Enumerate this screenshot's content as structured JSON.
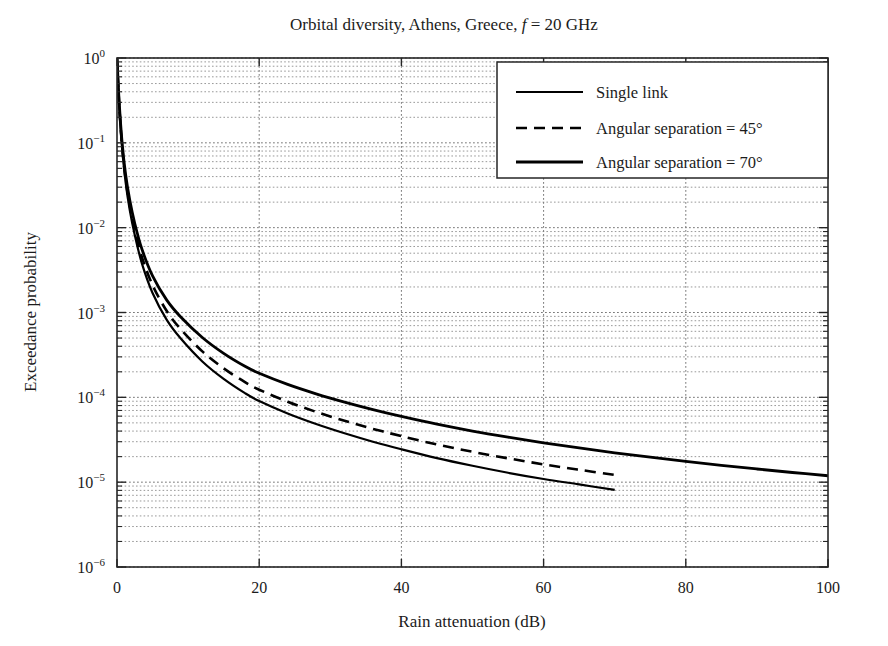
{
  "figure": {
    "title_main": "Orbital diversity, Athens, Greece, ",
    "title_italic": "f",
    "title_tail": " = 20 GHz",
    "background": "#ffffff"
  },
  "legend": {
    "position": "top-right",
    "items": [
      {
        "label": "Single link",
        "style": "solid",
        "width": 2.2,
        "color": "#000000"
      },
      {
        "label": "Angular separation = 45°",
        "style": "dashed",
        "width": 2.6,
        "color": "#000000"
      },
      {
        "label": "Angular separation = 70°",
        "style": "solid",
        "width": 2.8,
        "color": "#000000"
      }
    ]
  },
  "axes": {
    "x": {
      "label": "Rain attenuation (dB)",
      "ticks": [
        "0",
        "20",
        "40",
        "60",
        "80",
        "100"
      ],
      "tick_values": [
        0,
        20,
        40,
        60,
        80,
        100
      ],
      "min": 0,
      "max": 100,
      "scale": "linear"
    },
    "y": {
      "label": "Exceedance probability",
      "ticks": [
        "10",
        "10",
        "10",
        "10",
        "10",
        "10",
        "10"
      ],
      "exponents": [
        "0",
        "−1",
        "−2",
        "−3",
        "−4",
        "−5",
        "−6"
      ],
      "tick_values": [
        1,
        0.1,
        0.01,
        0.001,
        0.0001,
        1e-05,
        1e-06
      ],
      "min": 1e-06,
      "max": 1,
      "scale": "log"
    },
    "grid": "minor-and-major-dotted"
  },
  "chart_data": {
    "type": "line",
    "title": "Orbital diversity, Athens, Greece, f = 20 GHz",
    "xlabel": "Rain attenuation (dB)",
    "ylabel": "Exceedance probability",
    "xlim": [
      0,
      100
    ],
    "ylim": [
      1e-06,
      1
    ],
    "yscale": "log",
    "xscale": "linear",
    "grid": true,
    "legend_position": "upper right",
    "series": [
      {
        "name": "Single link",
        "style": "solid",
        "x": [
          0,
          0.3,
          0.7,
          1.2,
          1.8,
          2.5,
          3.5,
          5,
          7,
          9,
          12,
          15,
          18,
          20,
          24,
          28,
          32,
          36,
          40,
          45,
          50,
          55,
          60,
          65,
          70
        ],
        "y": [
          1.0,
          0.28,
          0.09,
          0.035,
          0.016,
          0.0082,
          0.0038,
          0.0017,
          0.00082,
          0.00049,
          0.000265,
          0.000165,
          0.000112,
          9.05e-05,
          6.45e-05,
          4.85e-05,
          3.77e-05,
          3e-05,
          2.44e-05,
          1.92e-05,
          1.56e-05,
          1.29e-05,
          1.09e-05,
          9.4e-06,
          8.1e-06
        ]
      },
      {
        "name": "Angular separation = 45°",
        "style": "dashed",
        "x": [
          0,
          0.3,
          0.7,
          1.2,
          1.8,
          2.5,
          3.5,
          5,
          7,
          9,
          12,
          15,
          18,
          20,
          24,
          28,
          32,
          36,
          40,
          45,
          50,
          55,
          60,
          65,
          70
        ],
        "y": [
          1.0,
          0.29,
          0.095,
          0.038,
          0.018,
          0.0094,
          0.0045,
          0.0021,
          0.00104,
          0.00063,
          0.000348,
          0.00022,
          0.000151,
          0.000123,
          8.88e-05,
          6.74e-05,
          5.29e-05,
          4.25e-05,
          3.49e-05,
          2.78e-05,
          2.28e-05,
          1.91e-05,
          1.62e-05,
          1.4e-05,
          1.22e-05
        ]
      },
      {
        "name": "Angular separation = 70°",
        "style": "solid",
        "x": [
          0,
          0.3,
          0.7,
          1.2,
          1.8,
          2.5,
          3.5,
          5,
          7,
          9,
          12,
          15,
          18,
          20,
          24,
          28,
          32,
          36,
          40,
          45,
          50,
          55,
          60,
          65,
          70,
          75,
          80,
          85,
          90,
          95,
          100
        ],
        "y": [
          1.0,
          0.31,
          0.105,
          0.043,
          0.021,
          0.0112,
          0.0056,
          0.0027,
          0.0014,
          0.00088,
          0.000508,
          0.00033,
          0.000232,
          0.000192,
          0.000142,
          0.00011,
          8.78e-05,
          7.16e-05,
          5.95e-05,
          4.82e-05,
          4e-05,
          3.39e-05,
          2.91e-05,
          2.53e-05,
          2.22e-05,
          1.97e-05,
          1.76e-05,
          1.58e-05,
          1.43e-05,
          1.3e-05,
          1.19e-05
        ]
      }
    ]
  },
  "plot_geometry": {
    "left": 117,
    "right": 828,
    "top": 58,
    "bottom": 567
  }
}
